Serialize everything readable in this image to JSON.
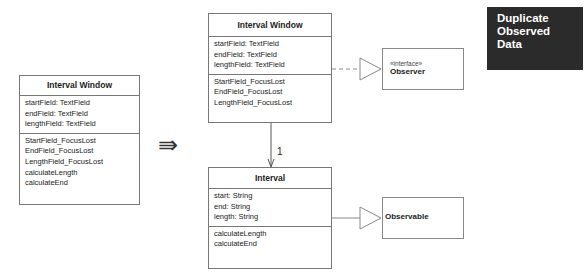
{
  "badge": {
    "line1": "Duplicate",
    "line2": "Observed Data"
  },
  "before": {
    "title": "Interval Window",
    "attributes": [
      "startField: TextField",
      "endField: TextField",
      "lengthField: TextField"
    ],
    "methods": [
      "StartField_FocusLost",
      "EndField_FocusLost",
      "LengthField_FocusLost",
      "calculateLength",
      "calculateEnd"
    ]
  },
  "transform_arrow": "⇛",
  "after": {
    "window": {
      "title": "Interval Window",
      "attributes": [
        "startField: TextField",
        "endField: TextField",
        "lengthField: TextField"
      ],
      "methods": [
        "StartField_FocusLost",
        "EndField_FocusLost",
        "LengthField_FocusLost"
      ]
    },
    "interval": {
      "title": "Interval",
      "attributes": [
        "start: String",
        "end: String",
        "length: String"
      ],
      "methods": [
        "calculateLength",
        "calculateEnd"
      ]
    },
    "observer": {
      "stereotype": "«interface»",
      "name": "Observer"
    },
    "observable": {
      "name": "Observable"
    },
    "association_multiplicity": "1"
  }
}
